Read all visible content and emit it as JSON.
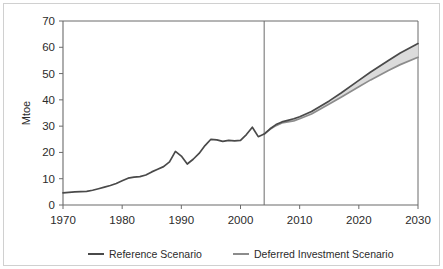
{
  "chart_data": {
    "type": "line",
    "title": "",
    "xlabel": "",
    "ylabel": "Mtoe",
    "xlim": [
      1970,
      2030
    ],
    "ylim": [
      0,
      70
    ],
    "xticks": [
      1970,
      1980,
      1990,
      2000,
      2010,
      2020,
      2030
    ],
    "xtick_labels": [
      "1970",
      "1980",
      "1990",
      "2000",
      "2010",
      "2020",
      "2030"
    ],
    "yticks": [
      0,
      10,
      20,
      30,
      40,
      50,
      60,
      70
    ],
    "ytick_labels": [
      "0",
      "10",
      "20",
      "30",
      "40",
      "50",
      "60",
      "70"
    ],
    "grid": false,
    "legend_position": "bottom",
    "projection_divider_year": 2004,
    "fill_between_label": "projection uncertainty band",
    "colors": {
      "reference": "#4a4a4a",
      "deferred": "#8c8c8c",
      "band_fill": "#d9d9d9",
      "axis": "#6b6b6b",
      "frame": "#d0d0d0",
      "text": "#2b2b2b"
    },
    "series": [
      {
        "name": "Reference Scenario",
        "color": "#4a4a4a",
        "x": [
          1970,
          1971,
          1972,
          1973,
          1974,
          1975,
          1976,
          1977,
          1978,
          1979,
          1980,
          1981,
          1982,
          1983,
          1984,
          1985,
          1986,
          1987,
          1988,
          1989,
          1990,
          1991,
          1992,
          1993,
          1994,
          1995,
          1996,
          1997,
          1998,
          1999,
          2000,
          2001,
          2002,
          2003,
          2004,
          2005,
          2006,
          2007,
          2008,
          2009,
          2010,
          2012,
          2015,
          2017,
          2020,
          2022,
          2025,
          2027,
          2030
        ],
        "values": [
          4.6,
          4.8,
          5.0,
          5.1,
          5.2,
          5.6,
          6.2,
          6.8,
          7.4,
          8.2,
          9.2,
          10.2,
          10.6,
          10.8,
          11.4,
          12.6,
          13.6,
          14.6,
          16.4,
          20.4,
          18.6,
          15.6,
          17.4,
          19.6,
          22.6,
          25.0,
          24.8,
          24.2,
          24.6,
          24.4,
          24.6,
          26.8,
          29.6,
          26.0,
          27.0,
          29.0,
          30.6,
          31.6,
          32.2,
          32.8,
          33.6,
          35.6,
          39.6,
          42.6,
          47.4,
          50.6,
          55.0,
          57.8,
          61.4
        ]
      },
      {
        "name": "Deferred Investment Scenario",
        "color": "#8c8c8c",
        "x": [
          2004,
          2005,
          2006,
          2007,
          2008,
          2009,
          2010,
          2012,
          2015,
          2017,
          2020,
          2022,
          2025,
          2027,
          2030
        ],
        "values": [
          27.0,
          28.8,
          30.2,
          31.2,
          31.6,
          32.0,
          32.8,
          34.6,
          38.4,
          41.0,
          45.0,
          47.6,
          51.2,
          53.4,
          56.2
        ]
      }
    ]
  },
  "legend": {
    "items": [
      {
        "label": "Reference Scenario",
        "color": "#4a4a4a"
      },
      {
        "label": "Deferred Investment Scenario",
        "color": "#8c8c8c"
      }
    ]
  },
  "axis": {
    "y_axis_title": "Mtoe"
  }
}
